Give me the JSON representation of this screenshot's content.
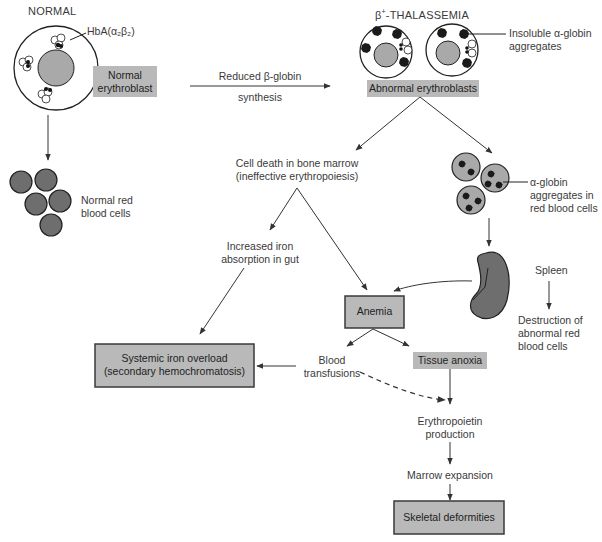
{
  "titles": {
    "normal": "NORMAL",
    "thalassemia_prefix": "β",
    "thalassemia_sup": "+",
    "thalassemia_suffix": "-THALASSEMIA"
  },
  "labels": {
    "hba": "HbA(α₂β₂)",
    "normal_erythroblast_line1": "Normal",
    "normal_erythroblast_line2": "erythroblast",
    "reduced_globin_line1": "Reduced β-globin",
    "reduced_globin_line2": "synthesis",
    "abnormal_erythroblasts": "Abnormal erythroblasts",
    "insoluble_line1": "Insoluble α-globin",
    "insoluble_line2": "aggregates",
    "normal_rbc_line1": "Normal red",
    "normal_rbc_line2": "blood cells",
    "cell_death_line1": "Cell death in bone marrow",
    "cell_death_line2": "(ineffective erythropoiesis)",
    "alpha_agg_line1": "α-globin",
    "alpha_agg_line2": "aggregates in",
    "alpha_agg_line3": "red blood cells",
    "iron_abs_line1": "Increased iron",
    "iron_abs_line2": "absorption in gut",
    "spleen": "Spleen",
    "destruction_line1": "Destruction of",
    "destruction_line2": "abnormal red",
    "destruction_line3": "blood cells",
    "anemia": "Anemia",
    "iron_overload_line1": "Systemic iron overload",
    "iron_overload_line2": "(secondary hemochromatosis)",
    "blood_line1": "Blood",
    "blood_line2": "transfusions",
    "tissue_anoxia": "Tissue anoxia",
    "epo_line1": "Erythropoietin",
    "epo_line2": "production",
    "marrow_expansion": "Marrow expansion",
    "skeletal": "Skeletal deformities"
  },
  "colors": {
    "box_fill": "#b9b9b9",
    "cell_fill": "#a9a9a9",
    "rbc_fill": "#6e6e6e",
    "line": "#333333"
  }
}
